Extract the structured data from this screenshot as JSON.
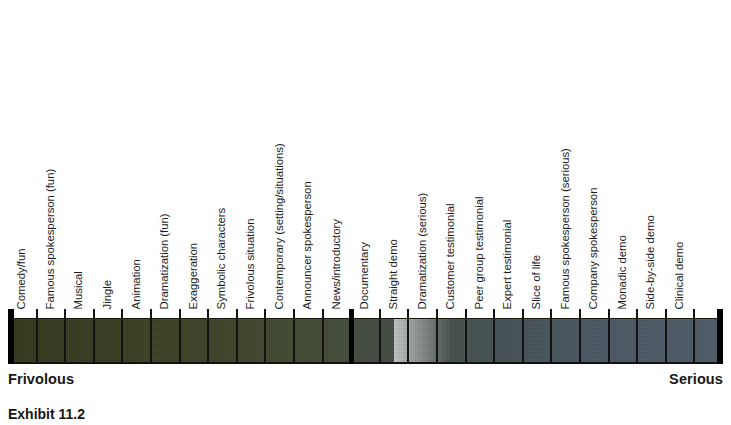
{
  "chart_data": {
    "type": "bar",
    "title": "",
    "subtitle": "",
    "xlabel": "",
    "ylabel": "",
    "grid": false,
    "legend": false,
    "orientation": "horizontal",
    "axis_anchors": {
      "left": "Frivolous",
      "right": "Serious"
    },
    "cell_count": 25,
    "major_divider_after_cell": 12,
    "categories": [
      "Comedy/fun",
      "Famous spokesperson (fun)",
      "Musical",
      "Jingle",
      "Animation",
      "Dramatization (fun)",
      "Exaggeration",
      "Symbolic characters",
      "Frivolous situation",
      "Contemporary (setting/situations)",
      "Announcer spokesperson",
      "News/introductory",
      "Documentary",
      "Straight demo",
      "Dramatization (serious)",
      "Customer testimonial",
      "Peer group testimonial",
      "Expert testimonial",
      "Slice of life",
      "Famous spokesperson (serious)",
      "Company spokesperson",
      "Monadic demo",
      "Side-by-side demo",
      "Clinical demo"
    ],
    "values": [
      1,
      2,
      3,
      4,
      5,
      6,
      7,
      8,
      9,
      10,
      11,
      12,
      13,
      14,
      15,
      16,
      17,
      18,
      19,
      20,
      21,
      22,
      23,
      24
    ],
    "xlim": [
      0,
      25
    ]
  },
  "colors": {
    "frivolous_end": "#313719",
    "midpoint": "#414a42",
    "serious_end": "#4d5a67",
    "rule": "#000000",
    "text": "#161616",
    "background": "#ffffff"
  },
  "caption": {
    "text": "Exhibit 11.2"
  }
}
